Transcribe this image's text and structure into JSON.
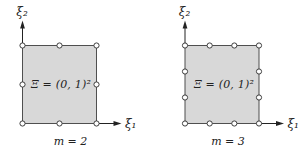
{
  "figure": {
    "background": "#ffffff",
    "description_labels_only": "two shaded unit squares with boundary sample points"
  },
  "style": {
    "background": "#ffffff",
    "square_fill": "#d8d8d8",
    "square_stroke": "#4f4f4f",
    "point_fill": "#ffffff",
    "point_stroke": "#3f3f3f",
    "axis_color": "#222222",
    "text_color": "#222222",
    "point_radius": 2.6
  },
  "diagrams": [
    {
      "name": "left",
      "axis_y_label": "ξ₂",
      "axis_x_label": "ξ₁",
      "region_label": "Ξ = (0, 1)²",
      "m_label": "m = 2",
      "points_per_side": 3
    },
    {
      "name": "right",
      "axis_y_label": "ξ₂",
      "axis_x_label": "ξ₁",
      "region_label": "Ξ = (0, 1)²",
      "m_label": "m = 3",
      "points_per_side": 4
    }
  ]
}
